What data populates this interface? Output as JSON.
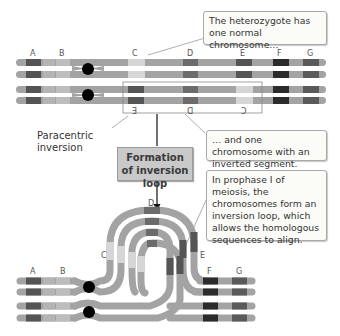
{
  "callouts": {
    "normal": "The heterozygote has one normal chromosome…",
    "inverted": "… and one chromosome with an inverted segment.",
    "loop": "In prophase I of meiosis, the chromosomes form an inversion loop, which allows the homologous sequences to align."
  },
  "labels": {
    "paracentric": "Paracentric inversion",
    "formation": "Formation of inversion loop"
  },
  "bands": {
    "top_normal": [
      "A",
      "B",
      "C",
      "D",
      "E",
      "F",
      "G"
    ],
    "top_inverted": [
      "E",
      "D",
      "C"
    ],
    "loop": [
      "A",
      "B",
      "C",
      "D",
      "E",
      "F",
      "G"
    ]
  },
  "colors": {
    "chromatid": "#a3a3a3",
    "band_light": "#b4b4b4",
    "band_pale": "#d6d6d6",
    "band_medium": "#6b6b6b",
    "band_dark": "#545454",
    "band_darkest": "#2b2b2b",
    "centromere": "#000000"
  }
}
